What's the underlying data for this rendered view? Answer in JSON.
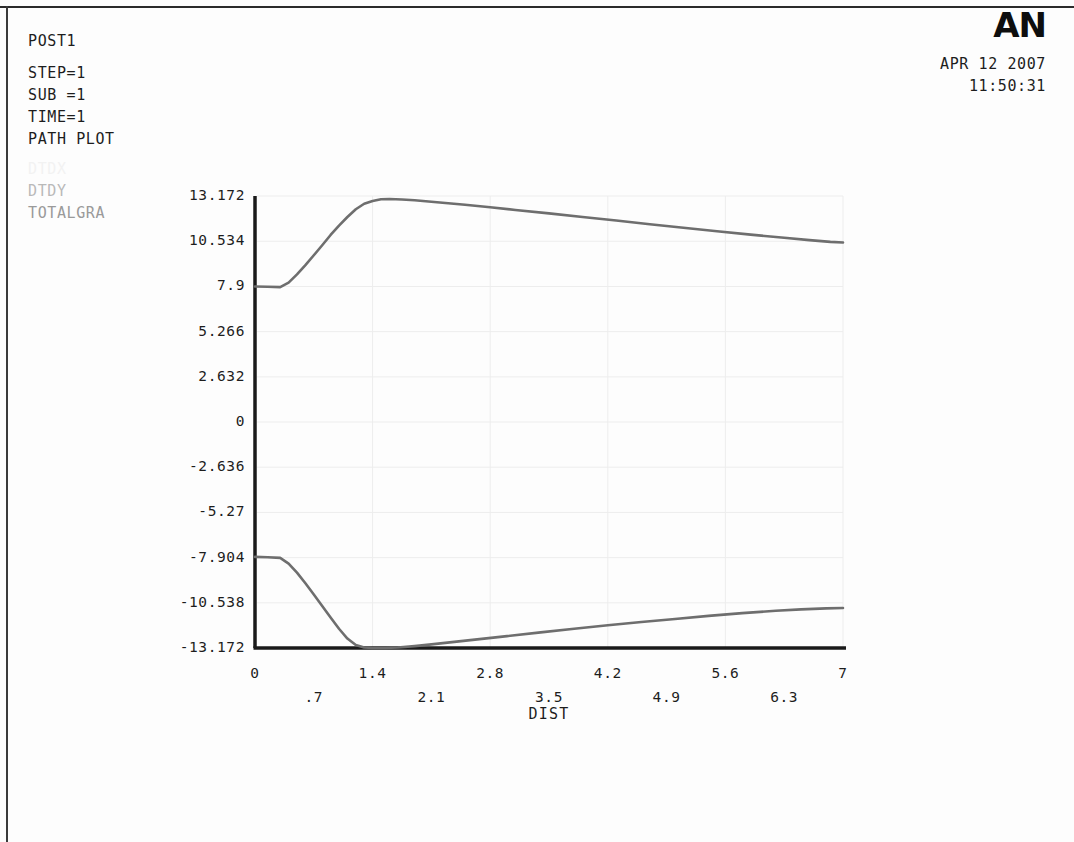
{
  "header": {
    "post_label": "POST1",
    "step": "STEP=1",
    "sub": "SUB =1",
    "time": "TIME=1",
    "plot_type": "PATH PLOT",
    "logo": "AN",
    "date": "APR 12 2007",
    "timestamp": "11:50:31"
  },
  "legend": {
    "items": [
      {
        "label": "DTDX",
        "color": "#f2f2f2"
      },
      {
        "label": "DTDY",
        "color": "#b9b9b9"
      },
      {
        "label": "TOTALGRA",
        "color": "#9a9a9a"
      }
    ]
  },
  "chart_data": {
    "type": "line",
    "title": "PATH PLOT",
    "xlabel": "DIST",
    "ylabel": "",
    "xlim": [
      0,
      7
    ],
    "ylim": [
      -13.172,
      13.172
    ],
    "grid": true,
    "legend_position": "top-left",
    "xticks_upper": [
      "0",
      "1.4",
      "2.8",
      "4.2",
      "5.6",
      "7"
    ],
    "xticks_upper_values": [
      0,
      1.4,
      2.8,
      4.2,
      5.6,
      7
    ],
    "xticks_lower": [
      ".7",
      "2.1",
      "3.5",
      "4.9",
      "6.3"
    ],
    "xticks_lower_values": [
      0.7,
      2.1,
      3.5,
      4.9,
      6.3
    ],
    "yticks": [
      "13.172",
      "10.534",
      "7.9",
      "5.266",
      "2.632",
      "0",
      "-2.636",
      "-5.27",
      "-7.904",
      "-10.538",
      "-13.172"
    ],
    "ytick_values": [
      13.172,
      10.534,
      7.9,
      5.266,
      2.632,
      0,
      -2.636,
      -5.27,
      -7.904,
      -10.538,
      -13.172
    ],
    "series": [
      {
        "name": "TOTALGRA",
        "color": "#6e6e6e",
        "x": [
          0,
          0.15,
          0.3,
          0.4,
          0.5,
          0.6,
          0.7,
          0.8,
          0.9,
          1.0,
          1.1,
          1.2,
          1.3,
          1.4,
          1.5,
          1.6,
          1.75,
          1.9,
          2.1,
          2.3,
          2.5,
          2.8,
          3.1,
          3.5,
          3.9,
          4.3,
          4.7,
          5.1,
          5.5,
          5.9,
          6.3,
          6.6,
          6.85,
          7.0
        ],
        "y": [
          7.9,
          7.88,
          7.86,
          8.12,
          8.6,
          9.14,
          9.72,
          10.3,
          10.9,
          11.45,
          11.95,
          12.4,
          12.72,
          12.88,
          12.98,
          13.0,
          12.97,
          12.92,
          12.84,
          12.75,
          12.66,
          12.52,
          12.36,
          12.16,
          11.95,
          11.74,
          11.53,
          11.32,
          11.12,
          10.92,
          10.74,
          10.6,
          10.5,
          10.46
        ]
      },
      {
        "name": "DTDY",
        "color": "#6e6e6e",
        "x": [
          0,
          0.15,
          0.3,
          0.4,
          0.5,
          0.6,
          0.7,
          0.8,
          0.9,
          1.0,
          1.1,
          1.2,
          1.3,
          1.4,
          1.55,
          1.7,
          1.9,
          2.1,
          2.4,
          2.7,
          3.0,
          3.4,
          3.8,
          4.2,
          4.6,
          5.0,
          5.4,
          5.8,
          6.2,
          6.5,
          6.8,
          7.0
        ],
        "y": [
          -7.86,
          -7.88,
          -7.92,
          -8.25,
          -8.78,
          -9.4,
          -10.05,
          -10.72,
          -11.4,
          -12.05,
          -12.62,
          -13.0,
          -13.14,
          -13.17,
          -13.17,
          -13.14,
          -13.06,
          -12.96,
          -12.8,
          -12.64,
          -12.48,
          -12.26,
          -12.05,
          -11.85,
          -11.66,
          -11.48,
          -11.3,
          -11.14,
          -11.0,
          -10.92,
          -10.86,
          -10.84
        ]
      }
    ]
  },
  "plot_geometry": {
    "left": 255,
    "right": 843,
    "top": 196,
    "bottom": 648
  }
}
